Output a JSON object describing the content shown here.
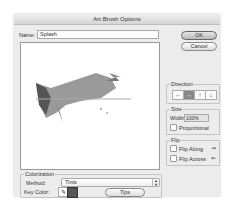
{
  "window": {
    "title": "Art Brush Options"
  },
  "name_field": {
    "label": "Name:",
    "value": "Splash"
  },
  "buttons": {
    "ok": "OK",
    "cancel": "Cancel",
    "tips": "Tips"
  },
  "direction": {
    "title": "Direction",
    "options": [
      {
        "icon": "arrow-left-icon",
        "glyph": "←",
        "active": false
      },
      {
        "icon": "arrow-right-icon",
        "glyph": "→",
        "active": true
      },
      {
        "icon": "arrow-up-icon",
        "glyph": "↑",
        "active": false
      },
      {
        "icon": "arrow-down-icon",
        "glyph": "↓",
        "active": false
      }
    ]
  },
  "size": {
    "title": "Size",
    "width_label": "Width:",
    "width_value": "100%",
    "proportional_label": "Proportional",
    "proportional_checked": false
  },
  "flip": {
    "title": "Flip",
    "along_label": "Flip Along",
    "across_label": "Flip Across",
    "along_icon": "⇝",
    "across_icon": "⇜"
  },
  "colorization": {
    "title": "Colorization",
    "method_label": "Method:",
    "method_value": "Tints",
    "key_color_label": "Key Color:",
    "eyedropper_glyph": "✎",
    "key_color": "#555555"
  },
  "select_arrows": "▲▼"
}
